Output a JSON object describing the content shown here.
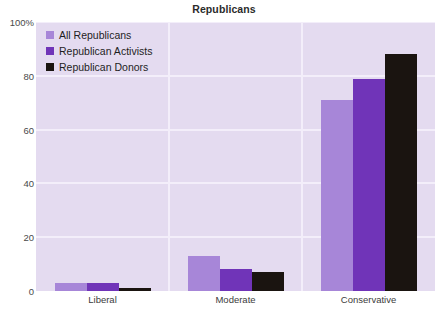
{
  "chart_data": {
    "type": "bar",
    "title": "Republicans",
    "xlabel": "",
    "ylabel": "",
    "categories": [
      "Liberal",
      "Moderate",
      "Conservative"
    ],
    "series": [
      {
        "name": "All Republicans",
        "color": "#a786d8",
        "values": [
          3,
          13,
          71
        ]
      },
      {
        "name": "Republican Activists",
        "color": "#7034b8",
        "values": [
          3,
          8,
          79
        ]
      },
      {
        "name": "Republican Donors",
        "color": "#1a1410",
        "values": [
          1,
          7,
          88
        ]
      }
    ],
    "ylim": [
      0,
      100
    ],
    "yticks": [
      "0",
      "20",
      "40",
      "60",
      "80",
      "100%"
    ],
    "ytick_values": [
      0,
      20,
      40,
      60,
      80,
      100
    ],
    "grid": true,
    "legend_position": "top-left",
    "plot_background": "#e4dbf0",
    "grid_color": "#f3eefa"
  }
}
